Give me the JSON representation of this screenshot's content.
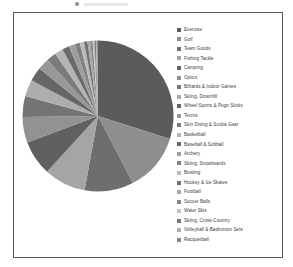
{
  "chart_data": {
    "type": "pie",
    "title": "",
    "legend_position": "right",
    "grid": false,
    "start_angle_deg": 0,
    "direction": "clockwise",
    "categories": [
      "Exercise",
      "Golf",
      "Team Goods",
      "Fishing Tackle",
      "Camping",
      "Optics",
      "Billiards & Indoor Games",
      "Skiing, Downhill",
      "Wheel Sports & Pogo Sticks",
      "Tennis",
      "Skin Diving & Scuba Gear",
      "Basketball",
      "Baseball & Softball",
      "Archery",
      "Skiing, Snowboards",
      "Bowling",
      "Hockey & Ice Skates",
      "Football",
      "Soccer Balls",
      "Water Skis",
      "Skiing, Cross-Country",
      "Volleyball & Badminton Sets",
      "Racquetball"
    ],
    "values": [
      30.0,
      12.5,
      10.5,
      9.0,
      7.5,
      5.5,
      4.5,
      3.6,
      3.0,
      2.5,
      2.1,
      1.8,
      1.5,
      1.3,
      1.1,
      0.9,
      0.75,
      0.6,
      0.5,
      0.4,
      0.3,
      0.25,
      0.2
    ],
    "colors": [
      "#5b5b5b",
      "#8e8e8e",
      "#6e6e6e",
      "#a5a5a5",
      "#606060",
      "#929292",
      "#747474",
      "#adadad",
      "#666666",
      "#989898",
      "#7b7b7b",
      "#b4b4b4",
      "#6a6a6a",
      "#9e9e9e",
      "#818181",
      "#bcbcbc",
      "#727272",
      "#a8a8a8",
      "#878787",
      "#c3c3c3",
      "#797979",
      "#b0b0b0",
      "#8b8b8b"
    ],
    "xlabel": "",
    "ylabel": ""
  },
  "frame": {
    "border_color": "#5a5a5a",
    "background": "#ffffff"
  }
}
